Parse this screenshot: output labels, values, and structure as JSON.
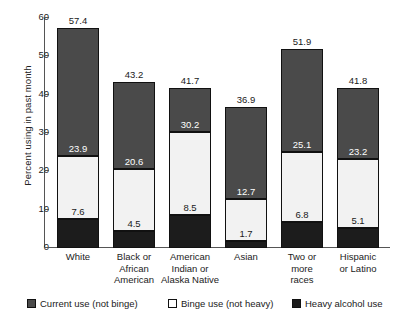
{
  "chart_data": {
    "type": "bar",
    "title": "",
    "xlabel": "",
    "ylabel": "Percent using in past month",
    "ylim": [
      0,
      60
    ],
    "yticks": [
      "0",
      "10",
      "20",
      "30",
      "40",
      "50",
      "60"
    ],
    "grid": false,
    "stacked": true,
    "legend_position": "bottom",
    "categories": [
      "White",
      "Black or African American",
      "American Indian or Alaska Native",
      "Asian",
      "Two or more races",
      "Hispanic or Latino"
    ],
    "category_lines": [
      [
        "White"
      ],
      [
        "Black or",
        "African",
        "American"
      ],
      [
        "American",
        "Indian or",
        "Alaska Native"
      ],
      [
        "Asian"
      ],
      [
        "Two or",
        "more",
        "races"
      ],
      [
        "Hispanic",
        "or Latino"
      ]
    ],
    "series": [
      {
        "name": "Heavy alcohol use",
        "color": "#1c1c1c",
        "values": [
          7.6,
          4.5,
          8.5,
          1.7,
          6.8,
          5.1
        ]
      },
      {
        "name": "Binge use (not heavy)",
        "color": "#f2f2f2",
        "cumulative_top": [
          23.9,
          20.6,
          30.2,
          12.7,
          25.1,
          23.2
        ]
      },
      {
        "name": "Current use (not binge)",
        "color": "#4a4a4a",
        "cumulative_top": [
          57.4,
          43.2,
          41.7,
          36.9,
          51.9,
          41.8
        ]
      }
    ],
    "heavy_labels": [
      "7.6",
      "4.5",
      "8.5",
      "1.7",
      "6.8",
      "5.1"
    ],
    "binge_top_labels": [
      "23.9",
      "20.6",
      "30.2",
      "12.7",
      "25.1",
      "23.2"
    ],
    "total_labels": [
      "57.4",
      "43.2",
      "41.7",
      "36.9",
      "51.9",
      "41.8"
    ],
    "legend": [
      {
        "label": "Current use (not binge)",
        "color": "#4a4a4a"
      },
      {
        "label": "Binge use (not heavy)",
        "color": "#ffffff"
      },
      {
        "label": "Heavy alcohol use",
        "color": "#1c1c1c"
      }
    ]
  }
}
